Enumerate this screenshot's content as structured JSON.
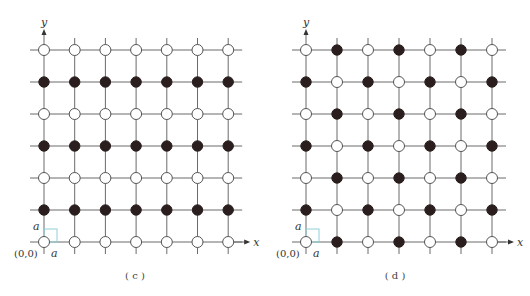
{
  "panels": [
    {
      "id": "c",
      "caption": "( c )",
      "origin_label": "(0,0)",
      "x_axis_label": "x",
      "y_axis_label": "y",
      "unit_label_x": "a",
      "unit_label_y": "a",
      "layout": {
        "x0": 44,
        "y0": 242,
        "dx": 30.7,
        "dy": 32,
        "cols": 7,
        "rows": 7,
        "caption_x": 135,
        "caption_y": 279
      },
      "pattern": "row-alternating",
      "rows_top_to_bottom": [
        [
          "white",
          "white",
          "white",
          "white",
          "white",
          "white",
          "white"
        ],
        [
          "black",
          "black",
          "black",
          "black",
          "black",
          "black",
          "black"
        ],
        [
          "white",
          "white",
          "white",
          "white",
          "white",
          "white",
          "white"
        ],
        [
          "black",
          "black",
          "black",
          "black",
          "black",
          "black",
          "black"
        ],
        [
          "white",
          "white",
          "white",
          "white",
          "white",
          "white",
          "white"
        ],
        [
          "black",
          "black",
          "black",
          "black",
          "black",
          "black",
          "black"
        ],
        [
          "white",
          "white",
          "white",
          "white",
          "white",
          "white",
          "white"
        ]
      ]
    },
    {
      "id": "d",
      "caption": "( d )",
      "origin_label": "(0,0)",
      "x_axis_label": "x",
      "y_axis_label": "y",
      "unit_label_x": "a",
      "unit_label_y": "a",
      "layout": {
        "x0": 306,
        "y0": 242,
        "dx": 31,
        "dy": 32,
        "cols": 7,
        "rows": 7,
        "caption_x": 395,
        "caption_y": 279
      },
      "pattern": "checkerboard",
      "rows_top_to_bottom": [
        [
          "white",
          "black",
          "white",
          "black",
          "white",
          "black",
          "white"
        ],
        [
          "black",
          "white",
          "black",
          "white",
          "black",
          "white",
          "black"
        ],
        [
          "white",
          "black",
          "white",
          "black",
          "white",
          "black",
          "white"
        ],
        [
          "black",
          "white",
          "black",
          "white",
          "black",
          "white",
          "black"
        ],
        [
          "white",
          "black",
          "white",
          "black",
          "white",
          "black",
          "white"
        ],
        [
          "black",
          "white",
          "black",
          "white",
          "black",
          "white",
          "black"
        ],
        [
          "white",
          "black",
          "white",
          "black",
          "white",
          "black",
          "white"
        ]
      ]
    }
  ],
  "colors": {
    "grid_line": "#6b6b6b",
    "black_atom": "#2a1e1e",
    "white_atom_fill": "#ffffff",
    "white_atom_stroke": "#555555",
    "unit_cell": "#8fd0d8"
  }
}
